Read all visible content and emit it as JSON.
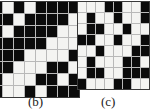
{
  "figure": {
    "type": "binary-pattern-grids",
    "colors": {
      "on": "#0b0b0b",
      "off": "#f4f4f2",
      "gridline": "#b9b9b9",
      "border": "#3a3a3a",
      "background": "#ffffff",
      "text": "#1a1a1a"
    },
    "panels": [
      {
        "id": "b",
        "caption": "(b)",
        "rows": 8,
        "cols": 8,
        "cropped_left": true,
        "matrix": [
          [
            1,
            0,
            1,
            0,
            1,
            1,
            1,
            1
          ],
          [
            1,
            1,
            0,
            1,
            1,
            1,
            1,
            0
          ],
          [
            1,
            0,
            1,
            1,
            1,
            1,
            0,
            0
          ],
          [
            1,
            1,
            1,
            1,
            1,
            0,
            0,
            0
          ],
          [
            1,
            1,
            1,
            0,
            0,
            0,
            0,
            1
          ],
          [
            1,
            1,
            0,
            0,
            0,
            1,
            1,
            0
          ],
          [
            1,
            0,
            0,
            0,
            1,
            1,
            0,
            1
          ],
          [
            1,
            0,
            0,
            1,
            0,
            1,
            1,
            1
          ]
        ]
      },
      {
        "id": "c",
        "caption": "(c)",
        "rows": 8,
        "cols": 8,
        "cropped_left": false,
        "matrix": [
          [
            0,
            0,
            0,
            1,
            1,
            0,
            0,
            1
          ],
          [
            0,
            1,
            0,
            0,
            1,
            0,
            0,
            1
          ],
          [
            0,
            1,
            1,
            0,
            0,
            1,
            0,
            0
          ],
          [
            1,
            1,
            0,
            0,
            1,
            0,
            0,
            1
          ],
          [
            0,
            0,
            1,
            0,
            0,
            0,
            1,
            1
          ],
          [
            0,
            1,
            0,
            0,
            0,
            1,
            1,
            0
          ],
          [
            0,
            1,
            1,
            0,
            0,
            1,
            1,
            1
          ],
          [
            1,
            0,
            0,
            0,
            1,
            1,
            0,
            0
          ]
        ]
      }
    ]
  }
}
